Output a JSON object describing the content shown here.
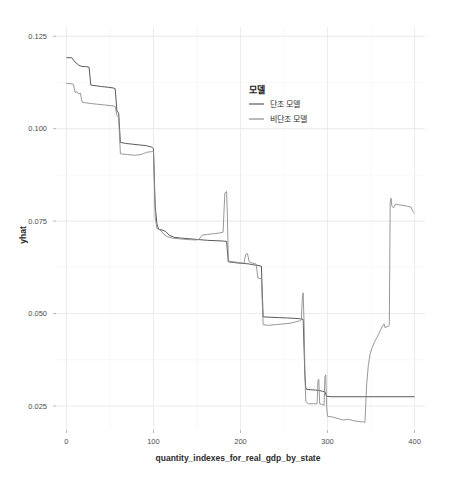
{
  "chart_data": {
    "type": "line",
    "title": "",
    "xlabel": "quantity_indexes_for_real_gdp_by_state",
    "ylabel": "yhat",
    "xlim": [
      -12,
      412
    ],
    "ylim": [
      0.0185,
      0.1275
    ],
    "xticks": [
      0,
      100,
      200,
      300,
      400
    ],
    "xtick_labels": [
      "0",
      "100",
      "200",
      "300",
      "400"
    ],
    "yticks": [
      0.025,
      0.05,
      0.075,
      0.1,
      0.125
    ],
    "ytick_labels": [
      "0.025",
      "0.050",
      "0.075",
      "0.100",
      "0.125"
    ],
    "grid": true,
    "legend_position": "right-inside",
    "legend_title": "모델",
    "series": [
      {
        "name": "단조 모델",
        "color": "#595959",
        "width": 1.0,
        "points": [
          [
            0,
            0.1192
          ],
          [
            6,
            0.1192
          ],
          [
            10,
            0.118
          ],
          [
            14,
            0.1172
          ],
          [
            18,
            0.1168
          ],
          [
            22,
            0.1168
          ],
          [
            26,
            0.1166
          ],
          [
            28,
            0.1118
          ],
          [
            34,
            0.1116
          ],
          [
            40,
            0.1114
          ],
          [
            48,
            0.1112
          ],
          [
            54,
            0.111
          ],
          [
            56,
            0.1108
          ],
          [
            58,
            0.1048
          ],
          [
            60,
            0.1042
          ],
          [
            62,
            0.0963
          ],
          [
            68,
            0.096
          ],
          [
            76,
            0.0958
          ],
          [
            84,
            0.0956
          ],
          [
            92,
            0.0954
          ],
          [
            98,
            0.095
          ],
          [
            100,
            0.0946
          ],
          [
            102,
            0.079
          ],
          [
            104,
            0.0742
          ],
          [
            106,
            0.0728
          ],
          [
            110,
            0.0726
          ],
          [
            114,
            0.0722
          ],
          [
            118,
            0.0712
          ],
          [
            124,
            0.0706
          ],
          [
            132,
            0.0704
          ],
          [
            142,
            0.0702
          ],
          [
            152,
            0.07
          ],
          [
            162,
            0.0698
          ],
          [
            172,
            0.0697
          ],
          [
            180,
            0.0696
          ],
          [
            184,
            0.0695
          ],
          [
            186,
            0.064
          ],
          [
            192,
            0.0638
          ],
          [
            200,
            0.0636
          ],
          [
            206,
            0.0635
          ],
          [
            210,
            0.0634
          ],
          [
            214,
            0.0632
          ],
          [
            220,
            0.063
          ],
          [
            224,
            0.0628
          ],
          [
            226,
            0.0491
          ],
          [
            234,
            0.049
          ],
          [
            244,
            0.0489
          ],
          [
            254,
            0.0488
          ],
          [
            262,
            0.0487
          ],
          [
            268,
            0.0486
          ],
          [
            272,
            0.0484
          ],
          [
            274,
            0.0332
          ],
          [
            275,
            0.03
          ],
          [
            276,
            0.0295
          ],
          [
            280,
            0.0294
          ],
          [
            286,
            0.0293
          ],
          [
            290,
            0.0292
          ],
          [
            294,
            0.029
          ],
          [
            297,
            0.0288
          ],
          [
            299,
            0.0276
          ],
          [
            305,
            0.0275
          ],
          [
            320,
            0.0275
          ],
          [
            340,
            0.0275
          ],
          [
            360,
            0.0275
          ],
          [
            380,
            0.0275
          ],
          [
            400,
            0.0275
          ]
        ]
      },
      {
        "name": "비단조 모델",
        "color": "#8c8c8c",
        "width": 0.9,
        "points": [
          [
            0,
            0.1122
          ],
          [
            4,
            0.1122
          ],
          [
            8,
            0.112
          ],
          [
            10,
            0.1098
          ],
          [
            12,
            0.11
          ],
          [
            14,
            0.1094
          ],
          [
            16,
            0.1096
          ],
          [
            18,
            0.1072
          ],
          [
            22,
            0.107
          ],
          [
            28,
            0.1068
          ],
          [
            36,
            0.1066
          ],
          [
            44,
            0.1064
          ],
          [
            52,
            0.1062
          ],
          [
            56,
            0.106
          ],
          [
            58,
            0.1036
          ],
          [
            60,
            0.103
          ],
          [
            62,
            0.0932
          ],
          [
            70,
            0.093
          ],
          [
            78,
            0.0928
          ],
          [
            86,
            0.093
          ],
          [
            92,
            0.0936
          ],
          [
            98,
            0.0938
          ],
          [
            100,
            0.094
          ],
          [
            102,
            0.076
          ],
          [
            104,
            0.073
          ],
          [
            108,
            0.0726
          ],
          [
            112,
            0.0714
          ],
          [
            116,
            0.0708
          ],
          [
            122,
            0.0704
          ],
          [
            130,
            0.0702
          ],
          [
            140,
            0.07
          ],
          [
            148,
            0.0699
          ],
          [
            152,
            0.07
          ],
          [
            156,
            0.0712
          ],
          [
            162,
            0.0714
          ],
          [
            170,
            0.0716
          ],
          [
            176,
            0.0718
          ],
          [
            180,
            0.072
          ],
          [
            182,
            0.0826
          ],
          [
            184,
            0.083
          ],
          [
            185,
            0.076
          ],
          [
            186,
            0.0642
          ],
          [
            192,
            0.064
          ],
          [
            198,
            0.0638
          ],
          [
            204,
            0.0636
          ],
          [
            206,
            0.066
          ],
          [
            208,
            0.0662
          ],
          [
            210,
            0.064
          ],
          [
            214,
            0.0636
          ],
          [
            218,
            0.0634
          ],
          [
            220,
            0.0596
          ],
          [
            224,
            0.0594
          ],
          [
            226,
            0.047
          ],
          [
            232,
            0.0468
          ],
          [
            240,
            0.047
          ],
          [
            250,
            0.0472
          ],
          [
            258,
            0.0474
          ],
          [
            264,
            0.0478
          ],
          [
            268,
            0.048
          ],
          [
            270,
            0.0484
          ],
          [
            271,
            0.054
          ],
          [
            272,
            0.0556
          ],
          [
            273,
            0.048
          ],
          [
            274,
            0.034
          ],
          [
            275,
            0.0262
          ],
          [
            278,
            0.0256
          ],
          [
            284,
            0.0256
          ],
          [
            288,
            0.0256
          ],
          [
            289,
            0.0318
          ],
          [
            290,
            0.0322
          ],
          [
            291,
            0.0256
          ],
          [
            294,
            0.0254
          ],
          [
            296,
            0.0252
          ],
          [
            297,
            0.033
          ],
          [
            298,
            0.0334
          ],
          [
            299,
            0.0246
          ],
          [
            300,
            0.0222
          ],
          [
            306,
            0.022
          ],
          [
            312,
            0.0216
          ],
          [
            318,
            0.0212
          ],
          [
            324,
            0.0214
          ],
          [
            330,
            0.021
          ],
          [
            336,
            0.0208
          ],
          [
            340,
            0.0207
          ],
          [
            343,
            0.0206
          ],
          [
            345,
            0.031
          ],
          [
            347,
            0.0362
          ],
          [
            349,
            0.0392
          ],
          [
            351,
            0.0406
          ],
          [
            353,
            0.0418
          ],
          [
            355,
            0.0428
          ],
          [
            357,
            0.0436
          ],
          [
            359,
            0.0446
          ],
          [
            361,
            0.0456
          ],
          [
            363,
            0.0466
          ],
          [
            365,
            0.0472
          ],
          [
            366,
            0.0462
          ],
          [
            368,
            0.0464
          ],
          [
            370,
            0.0466
          ],
          [
            371,
            0.0468
          ],
          [
            372,
            0.0802
          ],
          [
            373,
            0.0812
          ],
          [
            374,
            0.079
          ],
          [
            376,
            0.0786
          ],
          [
            378,
            0.0796
          ],
          [
            382,
            0.0794
          ],
          [
            388,
            0.0792
          ],
          [
            392,
            0.079
          ],
          [
            396,
            0.0788
          ],
          [
            398,
            0.0776
          ],
          [
            400,
            0.0772
          ]
        ]
      }
    ]
  },
  "legend": {
    "title": "모델",
    "items": [
      {
        "label": "단조 모델",
        "color": "#595959"
      },
      {
        "label": "비단조 모델",
        "color": "#8c8c8c"
      }
    ]
  },
  "axes": {
    "x_title": "quantity_indexes_for_real_gdp_by_state",
    "y_title": "yhat"
  },
  "colors": {
    "background": "#ffffff",
    "grid_major": "#e4e4e4",
    "grid_minor": "#f0f0f0",
    "text": "#4d4d4d",
    "series_monotonic": "#595959",
    "series_nonmonotonic": "#8c8c8c"
  }
}
